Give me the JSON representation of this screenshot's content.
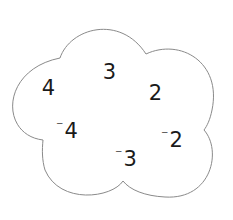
{
  "diagram": {
    "shape": "cloud",
    "outline_color": "#8a8a8a",
    "fill_color": "#ffffff",
    "text_color": "#1a1a1a",
    "numbers": [
      {
        "id": "n1",
        "sign": "",
        "value": "4",
        "display": "4",
        "x": 48,
        "y": 88
      },
      {
        "id": "n2",
        "sign": "",
        "value": "3",
        "display": "3",
        "x": 109,
        "y": 72
      },
      {
        "id": "n3",
        "sign": "",
        "value": "2",
        "display": "2",
        "x": 155,
        "y": 93
      },
      {
        "id": "n4",
        "sign": "⁻",
        "value": "4",
        "display": "-4",
        "x": 67,
        "y": 131
      },
      {
        "id": "n5",
        "sign": "⁻",
        "value": "2",
        "display": "-2",
        "x": 172,
        "y": 140
      },
      {
        "id": "n6",
        "sign": "⁻",
        "value": "3",
        "display": "-3",
        "x": 126,
        "y": 159
      }
    ]
  }
}
